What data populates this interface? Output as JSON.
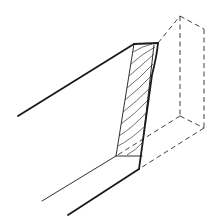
{
  "diagram": {
    "title": "",
    "colors": {
      "background": "#ffffff",
      "line": "#1a1a1a"
    },
    "elements": [
      {
        "name": "board-top-edge",
        "style": "solid-thick"
      },
      {
        "name": "board-bottom-inner-edge",
        "style": "solid-thin"
      },
      {
        "name": "board-bottom-outer-edge",
        "style": "solid-thick"
      },
      {
        "name": "cut-end-face",
        "style": "solid",
        "detail": "end-grain arcs"
      },
      {
        "name": "removed-block-outline",
        "style": "dashed"
      }
    ]
  }
}
